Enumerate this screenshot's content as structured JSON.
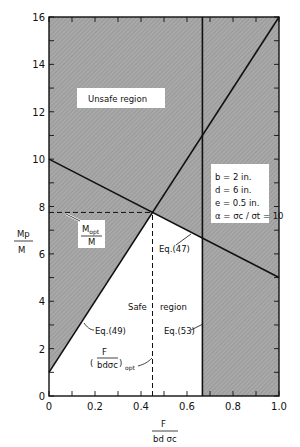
{
  "chart_data": {
    "type": "line",
    "title": "",
    "xlabel": "F / (b d σc)",
    "ylabel": "Mp / M",
    "xlim": [
      0,
      1.0
    ],
    "ylim": [
      0,
      16
    ],
    "xticks": [
      0,
      0.2,
      0.4,
      0.6,
      0.8,
      1.0
    ],
    "xtick_labels": [
      "0",
      "0.2",
      "0.4",
      "0.6",
      "0.8",
      "1.0"
    ],
    "yticks": [
      0,
      2,
      4,
      6,
      8,
      10,
      12,
      14,
      16
    ],
    "ytick_labels": [
      "0",
      "2",
      "4",
      "6",
      "8",
      "10",
      "12",
      "14",
      "16"
    ],
    "grid": false,
    "series": [
      {
        "name": "Eq.(49)",
        "x": [
          0,
          1.0
        ],
        "y": [
          1,
          16
        ],
        "style": "solid"
      },
      {
        "name": "Eq.(47)",
        "x": [
          0,
          1.0
        ],
        "y": [
          10,
          5
        ],
        "style": "solid"
      },
      {
        "name": "Eq.(53)",
        "x": [
          0.667,
          0.667
        ],
        "y": [
          0,
          16
        ],
        "style": "solid"
      },
      {
        "name": "Mopt/M",
        "x": [
          0,
          0.45
        ],
        "y": [
          7.75,
          7.75
        ],
        "style": "dashed"
      },
      {
        "name": "(F/bdσc)opt",
        "x": [
          0.45,
          0.45
        ],
        "y": [
          0,
          7.75
        ],
        "style": "dashed"
      }
    ],
    "optimum_point": {
      "x": 0.45,
      "y": 7.75
    },
    "regions": [
      {
        "name": "Unsafe region",
        "shaded": true
      },
      {
        "name": "Safe region",
        "shaded": false
      }
    ],
    "annotations": {
      "unsafe_region": "Unsafe region",
      "safe_region_a": "Safe",
      "safe_region_b": "region",
      "eq47": "Eq.(47)",
      "eq49": "Eq.(49)",
      "eq53": "Eq.(53)",
      "mopt_num": "M",
      "mopt_sub": "opt",
      "mopt_den": "M",
      "fopt_num": "F",
      "fopt_den": "bdσc",
      "fopt_sub": "opt"
    },
    "parameters": [
      "b = 2 in.",
      "d = 6 in.",
      "e = 0.5 in.",
      "α = σc / σt = 10"
    ],
    "ylabel_num": "Mp",
    "ylabel_den": "M",
    "xlabel_num": "F",
    "xlabel_den": "bd σc"
  }
}
